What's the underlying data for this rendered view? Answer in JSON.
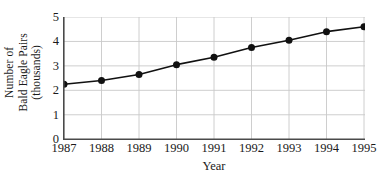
{
  "chart_data": {
    "type": "line",
    "title": "",
    "xlabel": "Year",
    "ylabel": "Number of Bald Eagle Pairs (thousands)",
    "ylabel_lines": [
      "Number of",
      "Bald Eagle Pairs",
      "(thousands)"
    ],
    "categories": [
      "1987",
      "1988",
      "1989",
      "1990",
      "1991",
      "1992",
      "1993",
      "1994",
      "1995"
    ],
    "x": [
      1987,
      1988,
      1989,
      1990,
      1991,
      1992,
      1993,
      1994,
      1995
    ],
    "values": [
      2.25,
      2.4,
      2.65,
      3.05,
      3.35,
      3.75,
      4.05,
      4.4,
      4.6
    ],
    "yticks": [
      "0",
      "1",
      "2",
      "3",
      "4",
      "5"
    ],
    "ytick_values": [
      0,
      1,
      2,
      3,
      4,
      5
    ],
    "ylim": [
      0,
      5
    ],
    "xlim": [
      1987,
      1995
    ],
    "grid": true,
    "legend": null,
    "marker": "filled-circle",
    "series_color": "#111111",
    "grid_color": "#c8c8c8",
    "axis_color": "#4a4a4a"
  }
}
